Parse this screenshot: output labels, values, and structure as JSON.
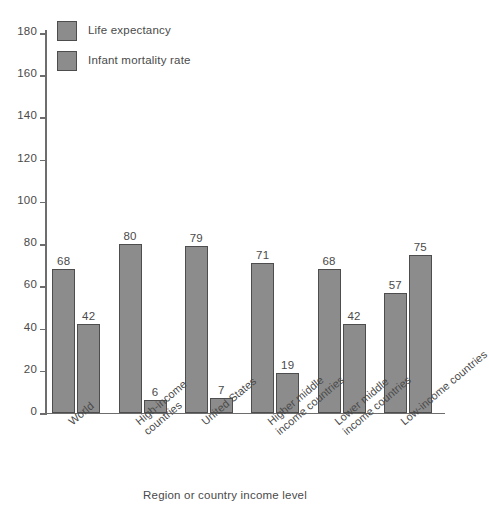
{
  "chart_data": {
    "type": "bar",
    "title": "",
    "xlabel": "Region or country income level",
    "ylabel": "",
    "ylim": [
      0,
      180
    ],
    "yticks": [
      0,
      20,
      40,
      60,
      80,
      100,
      120,
      140,
      160,
      180
    ],
    "grid": false,
    "legend_position": "top-left",
    "categories": [
      "World",
      "High-income countries",
      "United States",
      "Higher middle income countries",
      "Lower middle income countries",
      "Low-income countries"
    ],
    "category_lines": [
      [
        "World"
      ],
      [
        "High-income",
        "countries"
      ],
      [
        "United States"
      ],
      [
        "Higher middle",
        "income countries"
      ],
      [
        "Lower middle",
        "income countries"
      ],
      [
        "Low-income countries"
      ]
    ],
    "series": [
      {
        "name": "Life expectancy",
        "color": "#8c8c8c",
        "values": [
          68,
          80,
          79,
          71,
          68,
          57
        ]
      },
      {
        "name": "Infant mortality rate",
        "color": "#8c8c8c",
        "values": [
          42,
          6,
          7,
          19,
          42,
          75
        ]
      }
    ]
  },
  "axis": {
    "tick_labels": [
      "180",
      "160",
      "140",
      "120",
      "100",
      "80",
      "60",
      "40",
      "20",
      "0"
    ],
    "x_title": "Region or country income level"
  },
  "legend": {
    "items": [
      {
        "label": "Life expectancy"
      },
      {
        "label": "Infant mortality rate"
      }
    ]
  },
  "colors": {
    "bar_fill": "#8c8c8c",
    "bar_stroke": "#4d4d4d",
    "axis": "#6d6d6d",
    "text": "#4a4a4a",
    "background": "#ffffff"
  }
}
